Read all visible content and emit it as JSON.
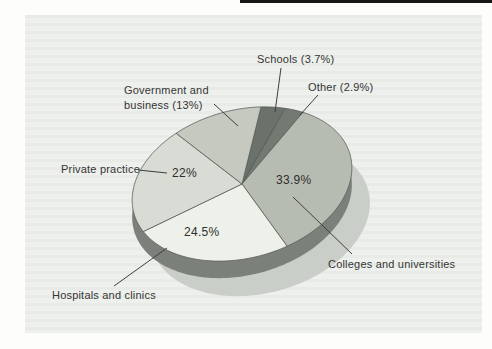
{
  "figure": {
    "page_color": "#fdfdfc",
    "panel_color": "#eef0ed",
    "top_rule_color": "#161616",
    "text_color": "#353535"
  },
  "chart_data": {
    "type": "pie",
    "style": "3d-perspective-with-shadow",
    "title": "",
    "order": "clockwise-from-top",
    "slices": [
      {
        "label": "Schools",
        "value": 3.7,
        "display": "Schools (3.7%)",
        "color": "#6b716b"
      },
      {
        "label": "Other",
        "value": 2.9,
        "display": "Other (2.9%)",
        "color": "#747a72"
      },
      {
        "label": "Colleges and universities",
        "value": 33.9,
        "inner_label": "33.9%",
        "color": "#b6bcb2"
      },
      {
        "label": "Hospitals and clinics",
        "value": 24.5,
        "inner_label": "24.5%",
        "color": "#eef0ea"
      },
      {
        "label": "Private practice",
        "value": 22,
        "inner_label": "22%",
        "color": "#d9dbd5"
      },
      {
        "label": "Government and business",
        "value": 13,
        "display": "Government and business (13%)",
        "display_line1": "Government and",
        "display_line2": "business (13%)",
        "color": "#c5c9c0"
      }
    ],
    "layout": {
      "cx": 242,
      "cy": 184,
      "rx": 112,
      "ry": 74,
      "rotation_deg": -15,
      "start_angle_deg": 20,
      "depth": 17,
      "rim_color": "#7b817a",
      "shadow_color": "#cacec8",
      "shadow_dx": 18,
      "shadow_dy": 35,
      "stroke_color": "#565b55",
      "pointer_line_color": "#3e3e3e"
    }
  }
}
